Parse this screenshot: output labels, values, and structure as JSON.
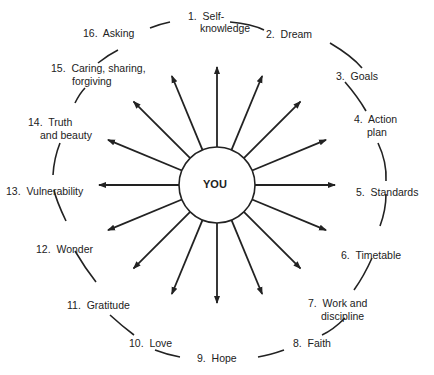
{
  "center": {
    "label": "YOU"
  },
  "nodes": [
    {
      "num": "1.",
      "text": "Self-",
      "text2": "knowledge"
    },
    {
      "num": "2.",
      "text": "Dream"
    },
    {
      "num": "3.",
      "text": "Goals"
    },
    {
      "num": "4.",
      "text": "Action",
      "text2": "plan"
    },
    {
      "num": "5.",
      "text": "Standards"
    },
    {
      "num": "6.",
      "text": "Timetable"
    },
    {
      "num": "7.",
      "text": "Work and",
      "text2": "discipline"
    },
    {
      "num": "8.",
      "text": "Faith"
    },
    {
      "num": "9.",
      "text": "Hope"
    },
    {
      "num": "10.",
      "text": "Love"
    },
    {
      "num": "11.",
      "text": "Gratitude"
    },
    {
      "num": "12.",
      "text": "Wonder"
    },
    {
      "num": "13.",
      "text": "Vulnerability"
    },
    {
      "num": "14.",
      "text": "Truth",
      "text2": "and beauty"
    },
    {
      "num": "15.",
      "text": "Caring, sharing,",
      "text2": "forgiving"
    },
    {
      "num": "16.",
      "text": "Asking"
    }
  ],
  "colors": {
    "ink": "#222222",
    "background": "#ffffff"
  }
}
